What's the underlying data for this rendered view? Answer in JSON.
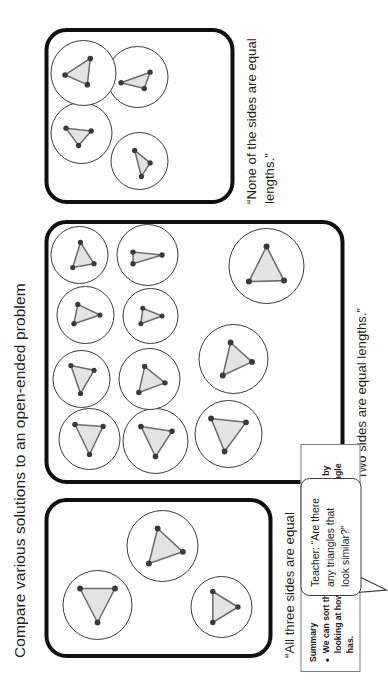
{
  "slide": {
    "title": "Compare various solutions to an open-ended problem",
    "groups": [
      {
        "id": "three",
        "caption": "“All three sides are equal lengths.”",
        "triangle_count": 3,
        "kind": "equilateral"
      },
      {
        "id": "two",
        "caption": "“Two sides are equal lengths.”",
        "triangle_count": 11,
        "kind": "isosceles"
      },
      {
        "id": "none",
        "caption": "“None of the sides are equal lengths.”",
        "triangle_count": 4,
        "kind": "scalene"
      }
    ]
  },
  "bubble": {
    "text": "Teacher: “Are there any triangles that look similar?”"
  },
  "summary": {
    "heading": "Summary",
    "bullet_marker": "•",
    "bullet_text": "We can sort the triangles into three groups by looking at how many equal sides each triangle has."
  },
  "colors": {
    "outline": "#101010",
    "triangle_fill": "#e3e3e1",
    "triangle_stroke": "#6e6e6e",
    "vertex": "#3a3a3a",
    "text": "#231f20",
    "background": "#ffffff"
  }
}
